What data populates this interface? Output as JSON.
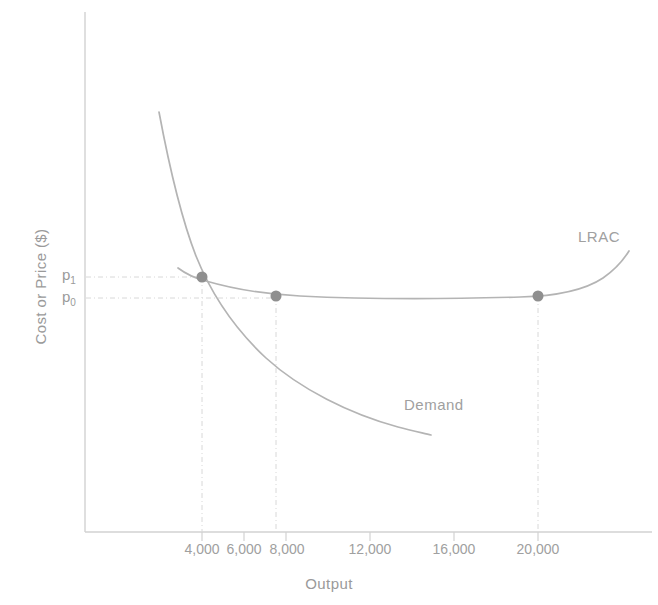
{
  "chart_data": {
    "type": "line",
    "title": "",
    "xlabel": "Output",
    "ylabel": "Cost or Price ($)",
    "xlim": [
      0,
      23000
    ],
    "ylim": [
      0,
      10
    ],
    "grid": false,
    "legend": "inline-labels",
    "xticks": [
      {
        "value": 4000,
        "label": "4,000",
        "px": 202
      },
      {
        "value": 6000,
        "label": "6,000",
        "px": 244
      },
      {
        "value": 8000,
        "label": "8,000",
        "px": 286
      },
      {
        "value": 12000,
        "label": "12,000",
        "px": 370
      },
      {
        "value": 16000,
        "label": "16,000",
        "px": 454
      },
      {
        "value": 20000,
        "label": "20,000",
        "px": 538
      }
    ],
    "yticks": [
      {
        "label": "p",
        "sub": "1",
        "px": 277
      },
      {
        "label": "p",
        "sub": "0",
        "px": 298
      }
    ],
    "series": [
      {
        "name": "LRAC",
        "label": "LRAC",
        "color": "#b4b4b4",
        "path": "M 178,268 C 186,274 194,278 206,281 C 230,288 260,294 300,296 C 360,299 450,299 520,297 C 560,296 585,290 603,278 C 616,269 624,259 629,251"
      },
      {
        "name": "Demand",
        "label": "Demand",
        "color": "#b4b4b4",
        "path": "M 159,112 C 168,160 180,215 196,256 C 212,296 236,330 266,358 C 300,389 350,414 398,427 C 412,431 423,433 431,435"
      }
    ],
    "points": [
      {
        "name": "equilibrium-p1",
        "x": 202,
        "y": 277
      },
      {
        "name": "equilibrium-p0-8000",
        "x": 276,
        "y": 296
      },
      {
        "name": "equilibrium-p0-20000",
        "x": 538,
        "y": 296
      }
    ],
    "guides": {
      "horizontal": [
        {
          "name": "p1-guide",
          "y": 277,
          "x_from": 86,
          "x_to": 203
        },
        {
          "name": "p0-guide",
          "y": 298,
          "x_from": 86,
          "x_to": 277
        }
      ],
      "vertical": [
        {
          "name": "q1-guide",
          "x": 202,
          "y_from": 277,
          "y_to": 532
        },
        {
          "name": "q0-guide",
          "x": 276,
          "y_from": 296,
          "y_to": 532
        },
        {
          "name": "q2-guide",
          "x": 538,
          "y_from": 296,
          "y_to": 532
        }
      ]
    },
    "axes": {
      "color": "#cccccc",
      "origin_x": 85,
      "baseline_y": 532,
      "top_y": 12,
      "right_x": 652
    },
    "annotations": [
      {
        "name": "lrac-label",
        "text": "LRAC",
        "x": 578,
        "y": 228
      },
      {
        "name": "demand-label",
        "text": "Demand",
        "x": 404,
        "y": 396
      }
    ]
  }
}
